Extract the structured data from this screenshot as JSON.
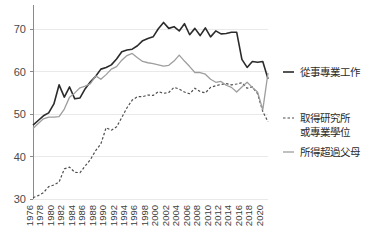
{
  "chart_data": {
    "type": "line",
    "title": "",
    "xlabel": "",
    "ylabel": "",
    "ylim": [
      30,
      75
    ],
    "xlim": [
      1976,
      2021
    ],
    "grid": true,
    "legend_position": "right",
    "yticks": [
      30,
      40,
      50,
      60,
      70
    ],
    "xticks": [
      1976,
      1978,
      1980,
      1982,
      1984,
      1986,
      1988,
      1990,
      1992,
      1994,
      1996,
      1998,
      2000,
      2002,
      2004,
      2006,
      2008,
      2010,
      2012,
      2014,
      2016,
      2018,
      2020
    ],
    "x": [
      1976,
      1977,
      1978,
      1979,
      1980,
      1981,
      1982,
      1983,
      1984,
      1985,
      1986,
      1987,
      1988,
      1989,
      1990,
      1991,
      1992,
      1993,
      1994,
      1995,
      1996,
      1997,
      1998,
      1999,
      2000,
      2001,
      2002,
      2003,
      2004,
      2005,
      2006,
      2007,
      2008,
      2009,
      2010,
      2011,
      2012,
      2013,
      2014,
      2015,
      2016,
      2017,
      2018,
      2019,
      2020,
      2021
    ],
    "series": [
      {
        "name": "從事專業工作",
        "style": "solid",
        "color": "#2b2b2b",
        "width": 1.6,
        "values": [
          47.4,
          48.5,
          49.6,
          50.3,
          52.4,
          56.9,
          54.0,
          56.4,
          53.6,
          53.8,
          56.0,
          57.6,
          58.9,
          60.6,
          61.0,
          61.6,
          63.0,
          64.7,
          65.1,
          65.3,
          66.1,
          67.3,
          67.8,
          68.2,
          70.1,
          71.6,
          70.2,
          70.6,
          69.6,
          71.3,
          68.7,
          70.2,
          68.5,
          70.3,
          68.2,
          69.6,
          68.9,
          69.0,
          69.3,
          69.3,
          62.9,
          61.0,
          62.4,
          62.2,
          62.4,
          58.3
        ]
      },
      {
        "name": "取得研究所或專業學位",
        "style": "dashed",
        "color": "#4d4d4d",
        "width": 1.2,
        "values": [
          30.3,
          30.8,
          31.5,
          32.9,
          33.3,
          34.0,
          37.1,
          37.5,
          36.3,
          36.2,
          37.8,
          39.3,
          41.4,
          43.0,
          46.8,
          46.2,
          47.0,
          49.2,
          51.5,
          53.3,
          54.1,
          54.1,
          54.5,
          54.4,
          55.3,
          54.9,
          55.1,
          56.3,
          55.9,
          55.2,
          54.8,
          56.1,
          55.3,
          55.0,
          56.3,
          56.7,
          57.0,
          57.2,
          56.9,
          57.1,
          57.4,
          56.1,
          56.4,
          54.8,
          50.6,
          48.2
        ]
      },
      {
        "name": "所得超過父母",
        "style": "solid",
        "color": "#9e9e9e",
        "width": 1.3,
        "values": [
          46.6,
          47.8,
          48.9,
          49.3,
          49.3,
          49.4,
          51.2,
          54.0,
          55.0,
          56.2,
          56.6,
          57.2,
          59.0,
          58.2,
          59.3,
          60.6,
          61.2,
          62.7,
          63.8,
          64.3,
          63.3,
          62.4,
          62.1,
          61.9,
          61.6,
          61.3,
          61.5,
          62.5,
          63.9,
          62.5,
          61.2,
          59.8,
          59.8,
          59.4,
          58.2,
          57.5,
          57.7,
          56.8,
          56.3,
          55.2,
          56.4,
          57.5,
          56.3,
          55.2,
          51.0,
          59.7
        ]
      }
    ]
  },
  "legend": {
    "items": [
      {
        "label": "從事專業工作",
        "label2": ""
      },
      {
        "label": "取得研究所",
        "label2": "或專業學位"
      },
      {
        "label": "所得超過父母",
        "label2": ""
      }
    ]
  }
}
